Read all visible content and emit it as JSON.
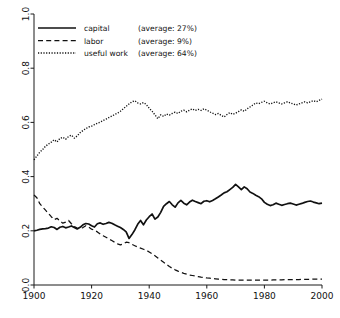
{
  "chart_data": {
    "type": "line",
    "title": "",
    "xlabel": "",
    "ylabel": "",
    "xlim": [
      1900,
      2000
    ],
    "ylim": [
      0.0,
      1.0
    ],
    "grid": false,
    "legend_position": "top-left",
    "xticks": [
      "1900",
      "1920",
      "1940",
      "1960",
      "1980",
      "2000"
    ],
    "xtick_values": [
      1900,
      1920,
      1940,
      1960,
      1980,
      2000
    ],
    "yticks": [
      "0.0",
      "0.2",
      "0.4",
      "0.6",
      "0.8",
      "1.0"
    ],
    "ytick_values": [
      0.0,
      0.2,
      0.4,
      0.6,
      0.8,
      1.0
    ],
    "x": [
      1900,
      1901,
      1902,
      1903,
      1904,
      1905,
      1906,
      1907,
      1908,
      1909,
      1910,
      1911,
      1912,
      1913,
      1914,
      1915,
      1916,
      1917,
      1918,
      1919,
      1920,
      1921,
      1922,
      1923,
      1924,
      1925,
      1926,
      1927,
      1928,
      1929,
      1930,
      1931,
      1932,
      1933,
      1934,
      1935,
      1936,
      1937,
      1938,
      1939,
      1940,
      1941,
      1942,
      1943,
      1944,
      1945,
      1946,
      1947,
      1948,
      1949,
      1950,
      1951,
      1952,
      1953,
      1954,
      1955,
      1956,
      1957,
      1958,
      1959,
      1960,
      1961,
      1962,
      1963,
      1964,
      1965,
      1966,
      1967,
      1968,
      1969,
      1970,
      1971,
      1972,
      1973,
      1974,
      1975,
      1976,
      1977,
      1978,
      1979,
      1980,
      1981,
      1982,
      1983,
      1984,
      1985,
      1986,
      1987,
      1988,
      1989,
      1990,
      1991,
      1992,
      1993,
      1994,
      1995,
      1996,
      1997,
      1998,
      1999,
      2000
    ],
    "series": [
      {
        "name": "capital",
        "style": "solid",
        "average_label": "(average: 27%)",
        "average_percent": 27,
        "values": [
          0.2,
          0.202,
          0.205,
          0.207,
          0.208,
          0.21,
          0.215,
          0.212,
          0.205,
          0.213,
          0.216,
          0.211,
          0.214,
          0.218,
          0.212,
          0.207,
          0.213,
          0.222,
          0.227,
          0.225,
          0.219,
          0.214,
          0.226,
          0.229,
          0.224,
          0.227,
          0.231,
          0.228,
          0.222,
          0.217,
          0.212,
          0.205,
          0.196,
          0.172,
          0.186,
          0.203,
          0.224,
          0.238,
          0.222,
          0.24,
          0.252,
          0.262,
          0.243,
          0.251,
          0.268,
          0.29,
          0.3,
          0.308,
          0.296,
          0.287,
          0.303,
          0.312,
          0.302,
          0.296,
          0.306,
          0.313,
          0.308,
          0.304,
          0.3,
          0.309,
          0.311,
          0.307,
          0.312,
          0.318,
          0.325,
          0.332,
          0.34,
          0.344,
          0.352,
          0.36,
          0.371,
          0.362,
          0.352,
          0.362,
          0.355,
          0.343,
          0.338,
          0.331,
          0.326,
          0.318,
          0.305,
          0.298,
          0.293,
          0.296,
          0.302,
          0.298,
          0.294,
          0.297,
          0.3,
          0.302,
          0.299,
          0.295,
          0.298,
          0.301,
          0.305,
          0.308,
          0.31,
          0.306,
          0.303,
          0.3,
          0.302
        ]
      },
      {
        "name": "labor",
        "style": "dashed",
        "average_label": "(average:  9%)",
        "average_percent": 9,
        "values": [
          0.332,
          0.322,
          0.3,
          0.288,
          0.276,
          0.264,
          0.252,
          0.241,
          0.246,
          0.236,
          0.228,
          0.232,
          0.238,
          0.226,
          0.216,
          0.21,
          0.208,
          0.212,
          0.219,
          0.214,
          0.206,
          0.202,
          0.196,
          0.188,
          0.182,
          0.176,
          0.17,
          0.164,
          0.158,
          0.152,
          0.148,
          0.152,
          0.158,
          0.156,
          0.15,
          0.145,
          0.14,
          0.136,
          0.132,
          0.128,
          0.122,
          0.115,
          0.108,
          0.1,
          0.092,
          0.084,
          0.076,
          0.068,
          0.062,
          0.056,
          0.051,
          0.047,
          0.043,
          0.04,
          0.037,
          0.035,
          0.033,
          0.031,
          0.029,
          0.028,
          0.026,
          0.025,
          0.024,
          0.023,
          0.022,
          0.021,
          0.02,
          0.02,
          0.019,
          0.019,
          0.018,
          0.018,
          0.018,
          0.018,
          0.018,
          0.018,
          0.018,
          0.018,
          0.018,
          0.018,
          0.018,
          0.018,
          0.018,
          0.019,
          0.019,
          0.019,
          0.019,
          0.02,
          0.02,
          0.02,
          0.02,
          0.02,
          0.02,
          0.021,
          0.021,
          0.021,
          0.021,
          0.022,
          0.022,
          0.022,
          0.022
        ]
      },
      {
        "name": "useful work",
        "style": "dotted",
        "average_label": "(average: 64%)",
        "average_percent": 64,
        "values": [
          0.462,
          0.476,
          0.49,
          0.5,
          0.512,
          0.52,
          0.527,
          0.536,
          0.528,
          0.541,
          0.545,
          0.538,
          0.548,
          0.553,
          0.542,
          0.55,
          0.562,
          0.57,
          0.577,
          0.583,
          0.586,
          0.592,
          0.597,
          0.601,
          0.607,
          0.612,
          0.618,
          0.623,
          0.629,
          0.634,
          0.641,
          0.65,
          0.659,
          0.668,
          0.676,
          0.68,
          0.672,
          0.668,
          0.673,
          0.666,
          0.652,
          0.641,
          0.628,
          0.614,
          0.628,
          0.622,
          0.631,
          0.627,
          0.633,
          0.638,
          0.633,
          0.641,
          0.645,
          0.639,
          0.645,
          0.65,
          0.644,
          0.648,
          0.644,
          0.65,
          0.645,
          0.639,
          0.634,
          0.629,
          0.633,
          0.626,
          0.62,
          0.629,
          0.636,
          0.63,
          0.634,
          0.64,
          0.646,
          0.641,
          0.65,
          0.657,
          0.664,
          0.672,
          0.669,
          0.674,
          0.678,
          0.672,
          0.668,
          0.672,
          0.676,
          0.672,
          0.668,
          0.672,
          0.676,
          0.672,
          0.668,
          0.664,
          0.668,
          0.672,
          0.676,
          0.672,
          0.676,
          0.68,
          0.676,
          0.681,
          0.686
        ]
      }
    ]
  },
  "legend": {
    "rows": [
      {
        "label": "capital",
        "average": "(average: 27%)"
      },
      {
        "label": "labor",
        "average": "(average:  9%)"
      },
      {
        "label": "useful work",
        "average": "(average: 64%)"
      }
    ]
  },
  "colors": {
    "ink": "#111111",
    "background": "#ffffff"
  }
}
